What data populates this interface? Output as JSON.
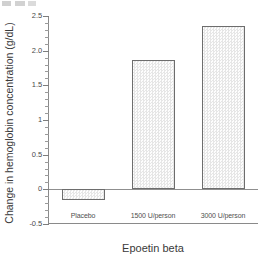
{
  "chart_data": {
    "type": "bar",
    "title": "",
    "subtitle": "",
    "xlabel": "Epoetin beta",
    "ylabel": "Change in hemoglobin concentration (g/dL)",
    "categories": [
      "Placebo",
      "1500 U/person",
      "3000 U/person"
    ],
    "values": [
      -0.15,
      1.87,
      2.35
    ],
    "series": [
      {
        "name": "Change in hemoglobin concentration",
        "values": [
          -0.15,
          1.87,
          2.35
        ]
      }
    ],
    "ylim": [
      -0.5,
      2.5
    ],
    "ytick_labels": [
      "2.5",
      "2.0",
      "1.5",
      "1",
      "0.5",
      "0",
      "-0.5"
    ],
    "ytick_values": [
      2.5,
      2.0,
      1.5,
      1.0,
      0.5,
      0.0,
      -0.5
    ],
    "yminor_step": 0.1,
    "grid": false,
    "legend": "none",
    "zero_line": 0,
    "bar_fill_color": "#fbfbfb",
    "bar_edge_color": "#6d6d6d",
    "axis_color": "#8a8a8a",
    "text_color": "#3a3a3a"
  }
}
